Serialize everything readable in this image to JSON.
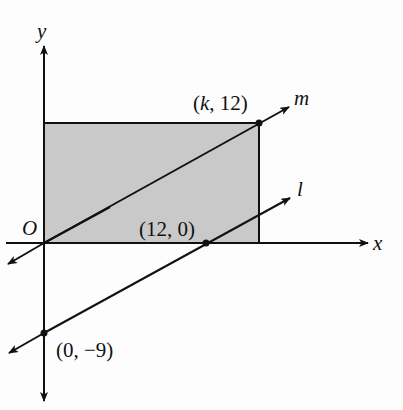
{
  "figure": {
    "axes": {
      "x_label": "x",
      "y_label": "y",
      "origin_label": "O"
    },
    "rectangle": {
      "fill": "#c8c8c8",
      "stroke": "#111111",
      "vertices": [
        "(0, 0)",
        "(0, 12)",
        "(k, 12)",
        "(k, 0)"
      ]
    },
    "lines": [
      {
        "name": "m",
        "label": "m",
        "passes_through": [
          "(0, 0)",
          "(k, 12)"
        ]
      },
      {
        "name": "l",
        "label": "l",
        "passes_through": [
          "(12, 0)",
          "(0, -9)"
        ]
      }
    ],
    "points": [
      {
        "label_prefix": "(",
        "label_var": "k",
        "label_suffix": ", 12)"
      },
      {
        "label": "(12, 0)"
      },
      {
        "label": "(0, −9)"
      }
    ],
    "relation": "line l is parallel to line m"
  }
}
